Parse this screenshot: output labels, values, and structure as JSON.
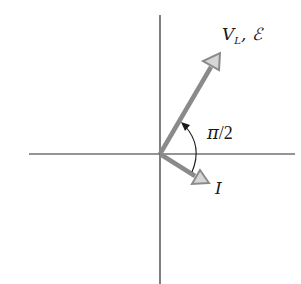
{
  "diagram": {
    "type": "phasor-diagram",
    "origin": [
      160,
      154
    ],
    "axes": {
      "horizontal": {
        "x1": 29,
        "x2": 295,
        "y": 154
      },
      "vertical": {
        "x": 160,
        "y1": 15,
        "y2": 284
      }
    },
    "vectors": [
      {
        "id": "voltage",
        "label_main": "V",
        "label_sub": "L",
        "label_extra": ", ℰ",
        "tip": [
          220,
          53
        ]
      },
      {
        "id": "current",
        "label": "I",
        "tip": [
          209,
          183
        ]
      }
    ],
    "angle": {
      "label_pi": "π",
      "label_rest": "/2",
      "meaning": "phase angle between V_L and I"
    }
  }
}
